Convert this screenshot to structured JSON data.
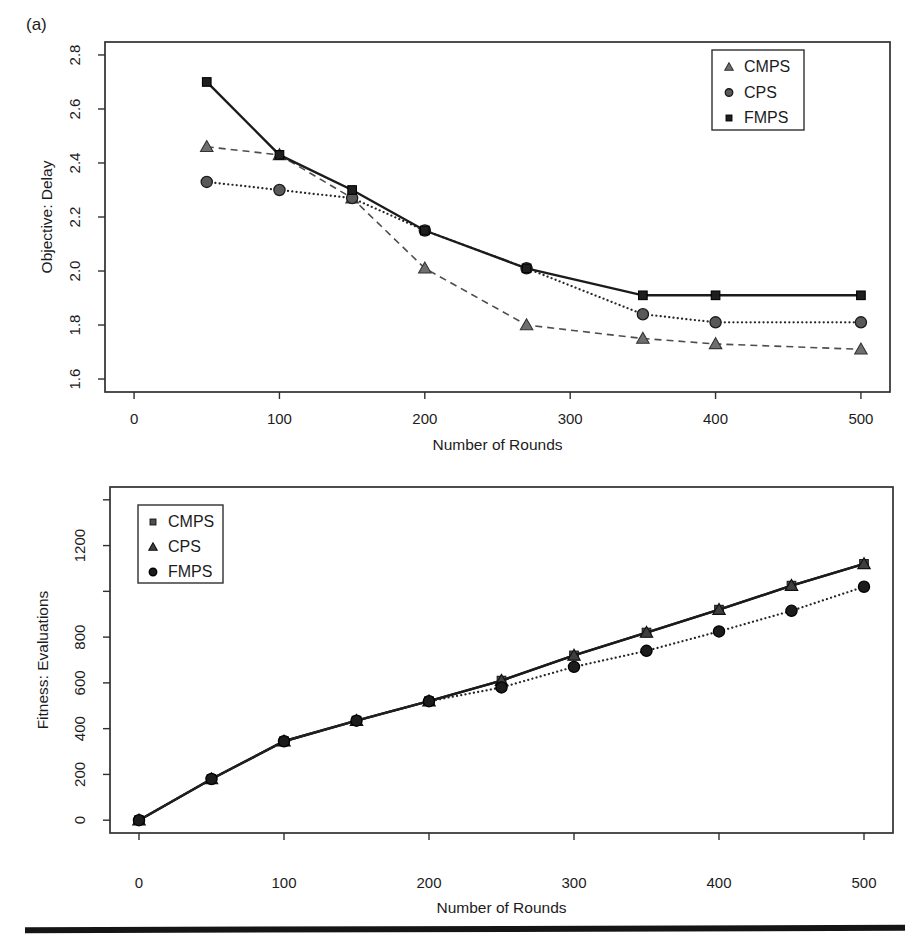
{
  "figure": {
    "panel_label": "(a)",
    "background": "#ffffff",
    "divider_color": "#151515"
  },
  "colors": {
    "axis": "#2f2f2f",
    "text": "#1c1c1c",
    "solid_line": "#1b1b1b",
    "dashed_line": "#4d4d4d",
    "dotted_line": "#262626"
  },
  "chart_data": [
    {
      "type": "line",
      "title": "",
      "xlabel": "Number of Rounds",
      "ylabel": "Objective: Delay",
      "xlim": [
        0,
        500
      ],
      "ylim": [
        1.6,
        2.8
      ],
      "grid": false,
      "legend_position": "top-right",
      "xticks": [
        0,
        100,
        200,
        300,
        400,
        500
      ],
      "yticks": [
        {
          "v": 1.6,
          "label": "1.6"
        },
        {
          "v": 1.8,
          "label": "1.8"
        },
        {
          "v": 2.0,
          "label": "2.0"
        },
        {
          "v": 2.2,
          "label": "2.2"
        },
        {
          "v": 2.4,
          "label": "2.4"
        },
        {
          "v": 2.6,
          "label": "2.6"
        },
        {
          "v": 2.8,
          "label": "2.8"
        }
      ],
      "x": [
        50,
        100,
        150,
        200,
        270,
        350,
        400,
        500
      ],
      "series": [
        {
          "name": "CMPS",
          "marker": "triangle",
          "line": "dashed",
          "fill": "#6f6f6f",
          "stroke": "#333333",
          "line_color": "#4d4d4d",
          "values": [
            2.46,
            2.43,
            2.27,
            2.01,
            1.8,
            1.75,
            1.73,
            1.71
          ]
        },
        {
          "name": "CPS",
          "marker": "circle",
          "line": "dotted",
          "fill": "#595959",
          "stroke": "#1a1a1a",
          "line_color": "#262626",
          "values": [
            2.33,
            2.3,
            2.27,
            2.15,
            2.01,
            1.84,
            1.81,
            1.81
          ]
        },
        {
          "name": "FMPS",
          "marker": "square",
          "line": "solid",
          "fill": "#1f1f1f",
          "stroke": "#000000",
          "line_color": "#1b1b1b",
          "values": [
            2.7,
            2.43,
            2.3,
            2.15,
            2.01,
            1.91,
            1.91,
            1.91
          ]
        }
      ],
      "legend_items": [
        {
          "label": "CMPS",
          "marker": "triangle"
        },
        {
          "label": "CPS",
          "marker": "circle"
        },
        {
          "label": "FMPS",
          "marker": "square"
        }
      ]
    },
    {
      "type": "line",
      "title": "",
      "xlabel": "Number of Rounds",
      "ylabel": "Fitness: Evaluations",
      "xlim": [
        0,
        500
      ],
      "ylim": [
        0,
        1400
      ],
      "grid": false,
      "legend_position": "top-left",
      "xticks": [
        0,
        100,
        200,
        300,
        400,
        500
      ],
      "yticks": [
        {
          "v": 0,
          "label": "0"
        },
        {
          "v": 200,
          "label": "200"
        },
        {
          "v": 400,
          "label": "400"
        },
        {
          "v": 600,
          "label": "600"
        },
        {
          "v": 800,
          "label": "800"
        },
        {
          "v": 1000,
          "label": ""
        },
        {
          "v": 1200,
          "label": "1200"
        },
        {
          "v": 1400,
          "label": ""
        }
      ],
      "x": [
        0,
        50,
        100,
        150,
        200,
        250,
        300,
        350,
        400,
        450,
        500
      ],
      "series": [
        {
          "name": "CMPS",
          "marker": "square",
          "line": "solid",
          "fill": "#4f4f4f",
          "stroke": "#1a1a1a",
          "line_color": "#1b1b1b",
          "values": [
            0,
            180,
            345,
            435,
            520,
            610,
            720,
            820,
            920,
            1025,
            1120
          ]
        },
        {
          "name": "CPS",
          "marker": "triangle",
          "line": "solid",
          "fill": "#3f3f3f",
          "stroke": "#101010",
          "line_color": "#1b1b1b",
          "values": [
            0,
            180,
            345,
            435,
            520,
            610,
            720,
            820,
            920,
            1025,
            1120
          ]
        },
        {
          "name": "FMPS",
          "marker": "circle",
          "line": "dotted",
          "fill": "#1c1c1c",
          "stroke": "#000000",
          "line_color": "#262626",
          "values": [
            0,
            180,
            345,
            435,
            520,
            580,
            670,
            740,
            825,
            915,
            1020
          ]
        }
      ],
      "legend_items": [
        {
          "label": "CMPS",
          "marker": "square"
        },
        {
          "label": "CPS",
          "marker": "triangle"
        },
        {
          "label": "FMPS",
          "marker": "circle"
        }
      ]
    }
  ]
}
